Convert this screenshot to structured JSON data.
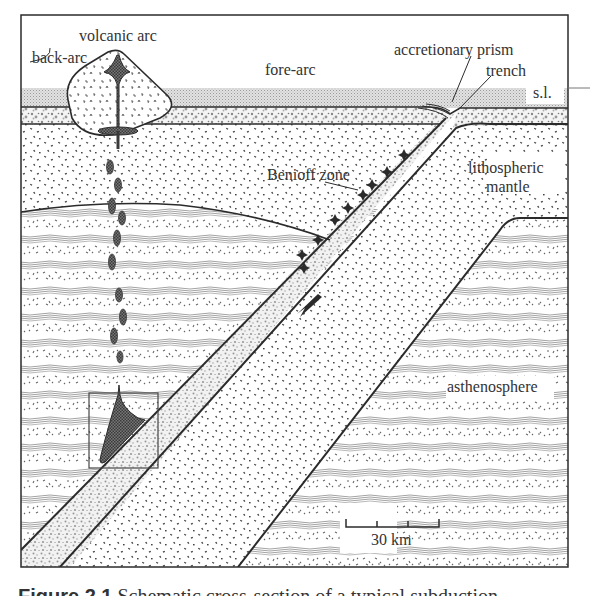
{
  "figure": {
    "labels": {
      "volcanic_arc": "volcanic arc",
      "back_arc": "back-arc",
      "fore_arc": "fore-arc",
      "accretionary_prism": "accretionary prism",
      "trench": "trench",
      "sea_level": "s.l.",
      "benioff_zone": "Benioff zone",
      "lithospheric_mantle_1": "lithospheric",
      "lithospheric_mantle_2": "mantle",
      "asthenosphere": "asthenosphere"
    },
    "scale_bar": {
      "label": "30 km",
      "divisions": 3
    },
    "caption": {
      "number": "Figure 2.1",
      "text": "Schematic cross-section of a typical subduction"
    },
    "colors": {
      "line": "#2b2b2b",
      "sea": "#d9d9d9",
      "magma": "#555555",
      "background": "#ffffff"
    }
  }
}
